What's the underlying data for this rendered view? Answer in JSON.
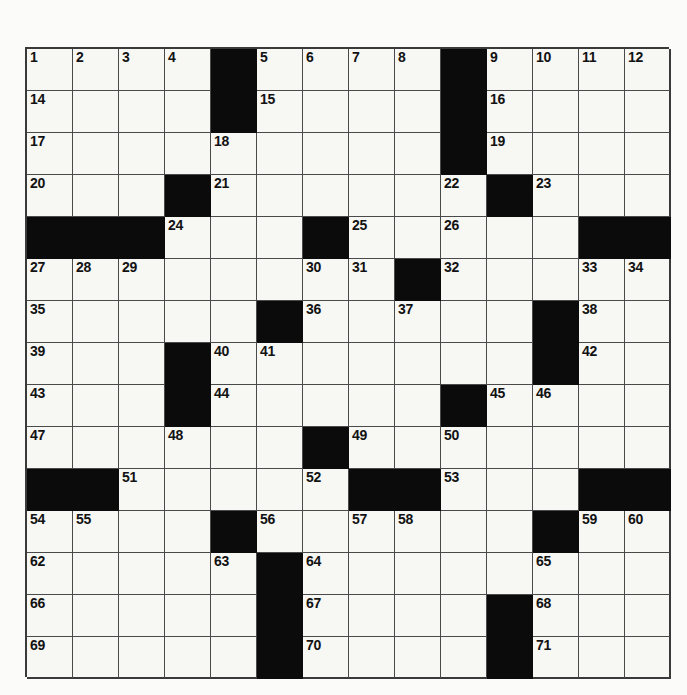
{
  "puzzle": {
    "title": "Crossword Puzzle Grid",
    "type": "crossword",
    "columns": 14,
    "rows": 15,
    "cell_size_px": 46,
    "colors": {
      "block": "#0b0b0b",
      "open": "#f7f7f4",
      "grid_line": "#4a4a4a",
      "number_text": "#121212",
      "page_background": "#fbfbf9"
    },
    "highest_clue_number": 71,
    "grid": [
      [
        "1",
        "2",
        "3",
        "4",
        "#",
        "5",
        "6",
        "7",
        "8",
        "#",
        "9",
        "10",
        "11",
        "12"
      ],
      [
        "14",
        "",
        "",
        "",
        "#",
        "15",
        "",
        "",
        "",
        "#",
        "16",
        "",
        "",
        ""
      ],
      [
        "17",
        "",
        "",
        "",
        "18",
        "",
        "",
        "",
        "",
        "#",
        "19",
        "",
        "",
        ""
      ],
      [
        "20",
        "",
        "",
        "#",
        "21",
        "",
        "",
        "",
        "",
        "22",
        "#",
        "23",
        "",
        ""
      ],
      [
        "#",
        "#",
        "#",
        "24",
        "",
        "",
        "#",
        "25",
        "",
        "26",
        "",
        "",
        "#",
        "#"
      ],
      [
        "27",
        "28",
        "29",
        "",
        "",
        "",
        "30",
        "31",
        "#",
        "32",
        "",
        "",
        "33",
        "34"
      ],
      [
        "35",
        "",
        "",
        "",
        "",
        "#",
        "36",
        "",
        "37",
        "",
        "",
        "#",
        "38",
        ""
      ],
      [
        "39",
        "",
        "",
        "#",
        "40",
        "41",
        "",
        "",
        "",
        "",
        "",
        "#",
        "42",
        ""
      ],
      [
        "43",
        "",
        "",
        "#",
        "44",
        "",
        "",
        "",
        "",
        "#",
        "45",
        "46",
        "",
        ""
      ],
      [
        "47",
        "",
        "",
        "48",
        "",
        "",
        "#",
        "49",
        "",
        "50",
        "",
        "",
        "",
        ""
      ],
      [
        "#",
        "#",
        "51",
        "",
        "",
        "",
        "52",
        "#",
        "#",
        "53",
        "",
        "",
        "#",
        "#"
      ],
      [
        "54",
        "55",
        "",
        "",
        "#",
        "56",
        "",
        "57",
        "58",
        "",
        "",
        "#",
        "59",
        "60"
      ],
      [
        "62",
        "",
        "",
        "",
        "63",
        "#",
        "64",
        "",
        "",
        "",
        "",
        "65",
        "",
        ""
      ],
      [
        "66",
        "",
        "",
        "",
        "",
        "#",
        "67",
        "",
        "",
        "",
        "#",
        "68",
        "",
        ""
      ],
      [
        "69",
        "",
        "",
        "",
        "",
        "#",
        "70",
        "",
        "",
        "",
        "#",
        "71",
        "",
        ""
      ]
    ],
    "grid_note_13_column": "13th clue number appears at column 14 of row 1 (number 13)",
    "row_labels": [
      "row-1",
      "row-2",
      "row-3",
      "row-4",
      "row-5",
      "row-6",
      "row-7",
      "row-8",
      "row-9",
      "row-10",
      "row-11",
      "row-12",
      "row-13",
      "row-14",
      "row-15"
    ],
    "cells": [
      [
        {
          "n": "1"
        },
        {
          "n": "2"
        },
        {
          "n": "3"
        },
        {
          "n": "4"
        },
        {
          "b": true
        },
        {
          "n": "5"
        },
        {
          "n": "6"
        },
        {
          "n": "7"
        },
        {
          "n": "8"
        },
        {
          "b": true
        },
        {
          "n": "9"
        },
        {
          "n": "10"
        },
        {
          "n": "11"
        },
        {
          "n": "12"
        }
      ]
    ],
    "clue_numbers_visible": [
      "1",
      "2",
      "3",
      "4",
      "5",
      "6",
      "7",
      "8",
      "9",
      "10",
      "11",
      "12",
      "13",
      "14",
      "15",
      "16",
      "17",
      "18",
      "19",
      "20",
      "21",
      "22",
      "23",
      "24",
      "25",
      "26",
      "27",
      "28",
      "29",
      "30",
      "31",
      "32",
      "33",
      "34",
      "35",
      "36",
      "37",
      "38",
      "39",
      "40",
      "41",
      "42",
      "43",
      "44",
      "45",
      "46",
      "47",
      "48",
      "49",
      "50",
      "51",
      "52",
      "53",
      "54",
      "55",
      "56",
      "57",
      "58",
      "59",
      "60",
      "61",
      "62",
      "63",
      "64",
      "65",
      "66",
      "67",
      "68",
      "69",
      "70",
      "71"
    ]
  },
  "layout": {
    "grid_origin_x": 25,
    "grid_origin_y": 47,
    "grid_width": 644,
    "grid_height": 630
  }
}
